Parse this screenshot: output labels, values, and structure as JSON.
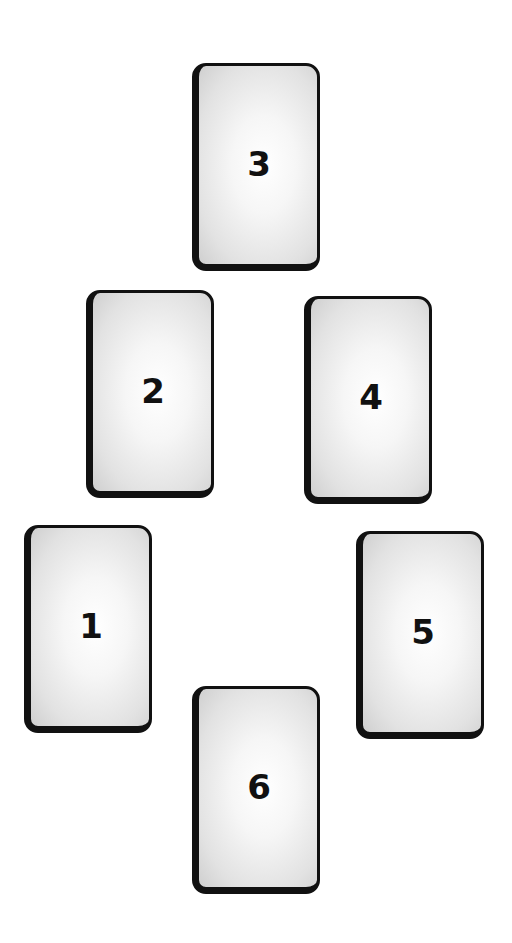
{
  "diagram": {
    "type": "card-spread-layout",
    "cards": [
      {
        "label": "1",
        "x": 24,
        "y": 525
      },
      {
        "label": "2",
        "x": 86,
        "y": 290
      },
      {
        "label": "3",
        "x": 192,
        "y": 63
      },
      {
        "label": "4",
        "x": 304,
        "y": 296
      },
      {
        "label": "5",
        "x": 356,
        "y": 531
      },
      {
        "label": "6",
        "x": 192,
        "y": 686
      }
    ]
  }
}
